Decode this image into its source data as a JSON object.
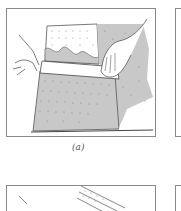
{
  "figure": {
    "panels": [
      {
        "id": "a",
        "caption": "(a)",
        "description": "Hands pressing a straight-edge onto a stippled sheet and tearing along it"
      },
      {
        "id": "b",
        "caption": "",
        "description": "Partial panel, right edge (cropped)"
      },
      {
        "id": "c",
        "caption": "",
        "description": "Partial lower panel with stippled strip (cropped)"
      },
      {
        "id": "d",
        "caption": "",
        "description": "Partial lower-right panel (cropped)"
      }
    ],
    "colors": {
      "frame": "#8a8a8a",
      "shade": "#c8c8c8",
      "ink": "#444444",
      "paper": "#ffffff"
    }
  }
}
